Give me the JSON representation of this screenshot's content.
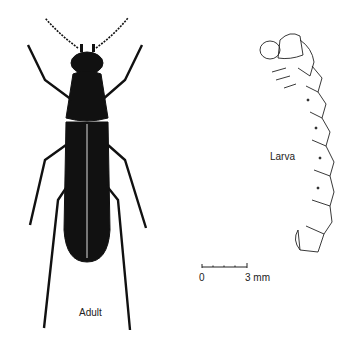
{
  "figure": {
    "labels": {
      "adult": "Adult",
      "larva": "Larva"
    },
    "scale_bar": {
      "start": "0",
      "end": "3 mm"
    },
    "colors": {
      "ink": "#111111",
      "background": "#ffffff"
    }
  }
}
